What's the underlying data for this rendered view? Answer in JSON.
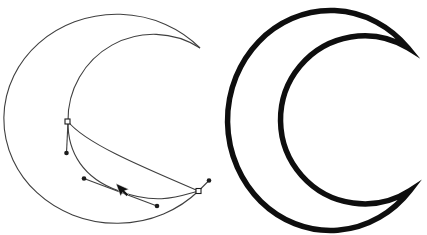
{
  "page": {
    "width": 427,
    "height": 235,
    "background": "#ffffff"
  },
  "editing_view": {
    "stroke_color": "#3f3f3f",
    "marker_color": "#1c1c1c",
    "stroke_width": 1.1,
    "curves": [
      {
        "name": "crescent-outer-arc-path",
        "d": "M 200 48 A 113 104.5 0 1 0 198.5 191",
        "interactable": true
      },
      {
        "name": "crescent-inner-arc-path",
        "d": "M 200 48 A 85.6 85.6 0 0 0 68 121.5",
        "interactable": true
      },
      {
        "name": "edited-segment-upper-curve",
        "d": "M 68 121.5 C 85 143 140 166 198.5 191",
        "interactable": true
      },
      {
        "name": "edited-segment-lower-curve",
        "d": "M 68 121.5 C 67.5 153 84 178.5 118 190.5 C 157 206 180 196 198.5 191",
        "interactable": true
      }
    ],
    "handle_lines": [
      {
        "name": "bezier-handle-line-top",
        "x1": 68,
        "y1": 121.5,
        "x2": 66.5,
        "y2": 153
      },
      {
        "name": "bezier-handle-line-middle",
        "x1": 84,
        "y1": 178.5,
        "x2": 157,
        "y2": 206
      },
      {
        "name": "bezier-handle-line-right",
        "x1": 198.5,
        "y1": 191,
        "x2": 209,
        "y2": 180.5
      }
    ],
    "anchor_squares": [
      {
        "name": "anchor-node-left",
        "x": 67.5,
        "y": 121.5,
        "size": 5
      },
      {
        "name": "anchor-node-right-cusp",
        "x": 198.5,
        "y": 191,
        "size": 5
      }
    ],
    "handle_dots": [
      {
        "name": "handle-end-dot-lower-left",
        "cx": 66.5,
        "cy": 153,
        "r": 2.3
      },
      {
        "name": "handle-end-dot-mid-left",
        "cx": 84,
        "cy": 178.5,
        "r": 2.3
      },
      {
        "name": "handle-end-dot-mid-right",
        "cx": 157,
        "cy": 206,
        "r": 2.3
      },
      {
        "name": "handle-end-dot-far-right",
        "cx": 209,
        "cy": 180.5,
        "r": 2.3
      }
    ],
    "cursor": {
      "name": "mouse-cursor-arrow-icon",
      "color": "#111111",
      "points": "116,183.5 120.6,196.2 122.6,192.4 126.6,196.3 128.5,194.4 124.6,190.8 128.8,189.3"
    }
  },
  "final_shape": {
    "stroke_color": "#0e0e0e",
    "fill": "#ffffff",
    "stroke_width": 5.5,
    "miter_limit": 9,
    "path": "M 408 48 A 103 110 0 1 0 410 190.5 A 84 84 0 1 1 408 48 Z"
  }
}
